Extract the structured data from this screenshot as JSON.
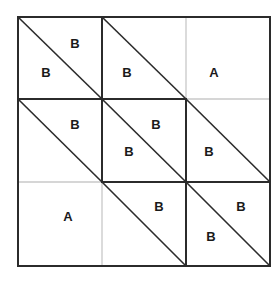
{
  "diagram": {
    "colors": {
      "dark_line": "#2b2b2b",
      "light_line": "#c8c8c8",
      "text": "#1a1a1a",
      "background": "#ffffff"
    },
    "grid": {
      "x": [
        18,
        102,
        186,
        270
      ],
      "y": [
        17,
        99,
        182,
        266
      ]
    },
    "segments": [
      {
        "x1": 18,
        "y1": 17,
        "x2": 270,
        "y2": 17,
        "style": "dark"
      },
      {
        "x1": 18,
        "y1": 266,
        "x2": 270,
        "y2": 266,
        "style": "dark"
      },
      {
        "x1": 18,
        "y1": 17,
        "x2": 18,
        "y2": 266,
        "style": "dark"
      },
      {
        "x1": 270,
        "y1": 17,
        "x2": 270,
        "y2": 266,
        "style": "dark"
      },
      {
        "x1": 18,
        "y1": 99,
        "x2": 186,
        "y2": 99,
        "style": "dark"
      },
      {
        "x1": 186,
        "y1": 99,
        "x2": 270,
        "y2": 99,
        "style": "light"
      },
      {
        "x1": 18,
        "y1": 182,
        "x2": 102,
        "y2": 182,
        "style": "light"
      },
      {
        "x1": 102,
        "y1": 182,
        "x2": 270,
        "y2": 182,
        "style": "dark"
      },
      {
        "x1": 102,
        "y1": 17,
        "x2": 102,
        "y2": 182,
        "style": "dark"
      },
      {
        "x1": 102,
        "y1": 182,
        "x2": 102,
        "y2": 266,
        "style": "light"
      },
      {
        "x1": 186,
        "y1": 17,
        "x2": 186,
        "y2": 99,
        "style": "light"
      },
      {
        "x1": 186,
        "y1": 99,
        "x2": 186,
        "y2": 266,
        "style": "dark"
      }
    ],
    "cells": [
      {
        "row": 0,
        "col": 0,
        "diagonal": true,
        "labels": [
          {
            "text": "B",
            "x": 75,
            "y": 43
          },
          {
            "text": "B",
            "x": 46,
            "y": 72
          }
        ]
      },
      {
        "row": 0,
        "col": 1,
        "diagonal": true,
        "labels": [
          {
            "text": "B",
            "x": 127,
            "y": 72
          }
        ]
      },
      {
        "row": 0,
        "col": 2,
        "diagonal": false,
        "labels": [
          {
            "text": "A",
            "x": 214,
            "y": 72
          }
        ]
      },
      {
        "row": 1,
        "col": 0,
        "diagonal": true,
        "labels": [
          {
            "text": "B",
            "x": 75,
            "y": 124
          }
        ]
      },
      {
        "row": 1,
        "col": 1,
        "diagonal": true,
        "labels": [
          {
            "text": "B",
            "x": 156,
            "y": 124
          },
          {
            "text": "B",
            "x": 129,
            "y": 151
          }
        ]
      },
      {
        "row": 1,
        "col": 2,
        "diagonal": true,
        "labels": [
          {
            "text": "B",
            "x": 209,
            "y": 151
          }
        ]
      },
      {
        "row": 2,
        "col": 0,
        "diagonal": false,
        "labels": [
          {
            "text": "A",
            "x": 68,
            "y": 216
          }
        ]
      },
      {
        "row": 2,
        "col": 1,
        "diagonal": true,
        "labels": [
          {
            "text": "B",
            "x": 159,
            "y": 206
          }
        ]
      },
      {
        "row": 2,
        "col": 2,
        "diagonal": true,
        "labels": [
          {
            "text": "B",
            "x": 241,
            "y": 206
          },
          {
            "text": "B",
            "x": 211,
            "y": 236
          }
        ]
      }
    ]
  }
}
